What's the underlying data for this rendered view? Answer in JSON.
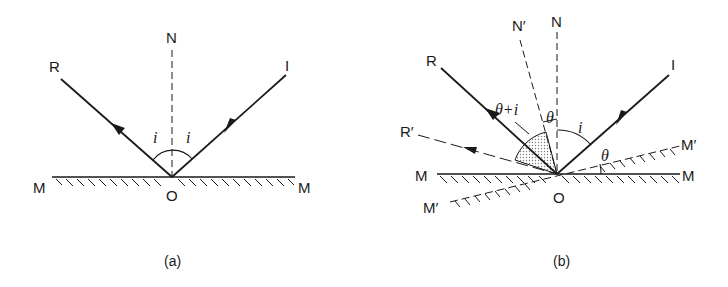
{
  "panel_a": {
    "caption": "(a)",
    "labels": {
      "normal": "N",
      "reflected": "R",
      "incident": "I",
      "mirror_left": "M",
      "mirror_right": "M",
      "origin": "O",
      "angle_left": "i",
      "angle_right": "i"
    }
  },
  "panel_b": {
    "caption": "(b)",
    "labels": {
      "normal": "N",
      "normal_rotated": "N′",
      "reflected": "R",
      "reflected_rotated": "R′",
      "incident": "I",
      "mirror_left": "M",
      "mirror_right": "M",
      "mirror_rotated_right": "M′",
      "mirror_rotated_left": "M′",
      "origin": "O",
      "angle_theta_plus_i": "θ+i",
      "angle_theta_normal": "θ",
      "angle_i": "i",
      "angle_theta_mirror": "θ"
    }
  },
  "colors": {
    "ink": "#1a1a1a",
    "shade": "#bdbdbd",
    "background": "#ffffff"
  }
}
